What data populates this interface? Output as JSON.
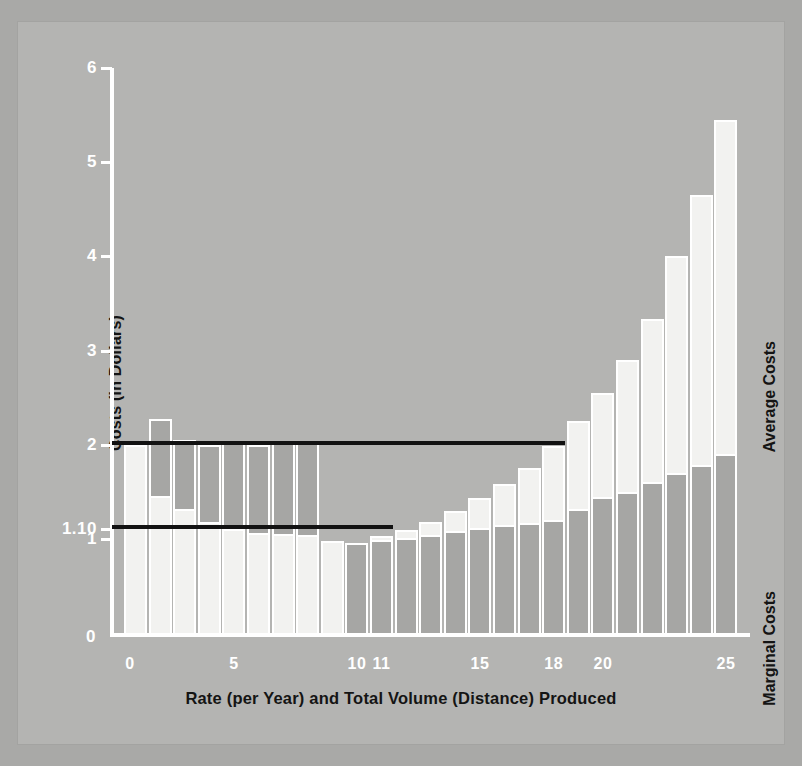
{
  "figure": {
    "background_color": "#b4b4b2",
    "axis_color": "#ffffff",
    "avg_bar_color": "#f2f2f0",
    "mc_bar_color": "#a6a6a4",
    "ref_line_color": "#121212"
  },
  "axes": {
    "y_title": "Costs (in Dollars)",
    "x_title": "Rate (per Year) and Total Volume (Distance) Produced",
    "y_ticks": [
      "0",
      "1",
      "1.10",
      "2",
      "3",
      "4",
      "5",
      "6"
    ],
    "x_ticks": [
      "0",
      "5",
      "10",
      "11",
      "15",
      "18",
      "20",
      "25"
    ],
    "origin_label": "0"
  },
  "legend": {
    "average_costs": "Average Costs",
    "marginal_costs": "Marginal Costs"
  },
  "chart_data": {
    "type": "bar",
    "title": "",
    "xlabel": "Rate (per Year) and Total Volume (Distance) Produced",
    "ylabel": "Costs (in Dollars)",
    "xlim": [
      0,
      25
    ],
    "ylim": [
      0,
      6
    ],
    "ytick_values": [
      0,
      1,
      1.1,
      2,
      3,
      4,
      5,
      6
    ],
    "ytick_labels": [
      "0",
      "1",
      "1.10",
      "2",
      "3",
      "4",
      "5",
      "6"
    ],
    "xtick_values": [
      0,
      5,
      10,
      11,
      15,
      18,
      20,
      25
    ],
    "xtick_labels": [
      "0",
      "5",
      "10",
      "11",
      "15",
      "18",
      "20",
      "25"
    ],
    "grid": false,
    "legend_position": "right-rotated",
    "categories": [
      1,
      2,
      3,
      4,
      5,
      6,
      7,
      8,
      9,
      10,
      11,
      12,
      13,
      14,
      15,
      16,
      17,
      18,
      19,
      20,
      21,
      22,
      23,
      24,
      25
    ],
    "series": [
      {
        "name": "Average Costs",
        "color": "#f2f2f0",
        "values": [
          2.0,
          1.45,
          1.32,
          1.18,
          1.1,
          1.06,
          1.05,
          1.04,
          0.98,
          0.96,
          1.03,
          1.09,
          1.18,
          1.3,
          1.43,
          1.58,
          1.75,
          1.99,
          2.25,
          2.55,
          2.9,
          3.33,
          4.0,
          4.65,
          5.45
        ]
      },
      {
        "name": "Marginal Costs",
        "color": "#a6a6a4",
        "values": [
          0.0,
          0.82,
          0.73,
          0.82,
          0.92,
          0.94,
          0.98,
          0.98,
          0.0,
          0.96,
          0.99,
          1.01,
          1.04,
          1.08,
          1.12,
          1.15,
          1.17,
          1.2,
          1.32,
          1.44,
          1.5,
          1.6,
          1.7,
          1.78,
          1.9
        ]
      }
    ],
    "reference_lines": [
      {
        "label": "2",
        "value": 2.0,
        "x_start": 0,
        "x_end": 18,
        "color": "#121212"
      },
      {
        "label": "1.10",
        "value": 1.1,
        "x_start": 0,
        "x_end": 11,
        "color": "#121212"
      }
    ]
  }
}
